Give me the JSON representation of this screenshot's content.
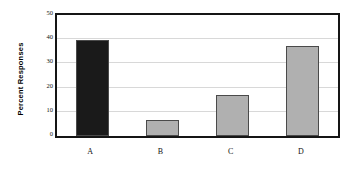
{
  "chart_data": {
    "type": "bar",
    "title": "",
    "subtitle": "",
    "xlabel": "",
    "ylabel": "Percent Responses",
    "categories": [
      "A",
      "B",
      "C",
      "D"
    ],
    "values": [
      39.5,
      6.5,
      17,
      37
    ],
    "series": [
      {
        "name": "Percent Responses",
        "values": [
          39.5,
          6.5,
          17,
          37
        ]
      }
    ],
    "ylim": [
      0,
      50
    ],
    "y_ticks": [
      0,
      10,
      20,
      30,
      40,
      50
    ],
    "y_tick_labels": [
      "0",
      "10",
      "20",
      "30",
      "40",
      "50"
    ],
    "x_tick_labels": [
      "A",
      "B",
      "C",
      "D"
    ],
    "grid": true,
    "grid_axis": "y",
    "legend": false,
    "legend_position": "none",
    "bar_colors": [
      "#1a1a1a",
      "#b0b0b0",
      "#b0b0b0",
      "#b0b0b0"
    ],
    "bar_edge_color": "#4a4a4a",
    "plot_border_color": "#151515",
    "gridline_color": "#d8d8d8",
    "background_color": "#ffffff"
  }
}
